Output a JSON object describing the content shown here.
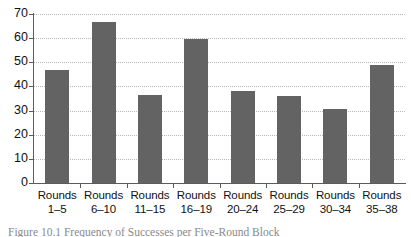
{
  "chart_data": {
    "type": "bar",
    "title": "",
    "subtitle": "",
    "xlabel": "",
    "ylabel": "",
    "ylim": [
      0,
      70
    ],
    "yticks": [
      0,
      10,
      20,
      30,
      40,
      50,
      60,
      70
    ],
    "ytick_labels": [
      "0",
      "10",
      "20",
      "30",
      "40",
      "50",
      "60",
      "70"
    ],
    "grid": true,
    "legend": false,
    "legend_position": "none",
    "categories": [
      "Rounds 1–5",
      "Rounds 6–10",
      "Rounds 11–15",
      "Rounds 16–19",
      "Rounds 20–24",
      "Rounds 25–29",
      "Rounds 30–34",
      "Rounds 35–38"
    ],
    "category_lines": [
      {
        "line1": "Rounds",
        "line2": "1–5"
      },
      {
        "line1": "Rounds",
        "line2": "6–10"
      },
      {
        "line1": "Rounds",
        "line2": "11–15"
      },
      {
        "line1": "Rounds",
        "line2": "16–19"
      },
      {
        "line1": "Rounds",
        "line2": "20–24"
      },
      {
        "line1": "Rounds",
        "line2": "25–29"
      },
      {
        "line1": "Rounds",
        "line2": "30–34"
      },
      {
        "line1": "Rounds",
        "line2": "35–38"
      }
    ],
    "values": [
      47,
      66.5,
      36.5,
      59.5,
      38,
      36,
      30.5,
      49
    ],
    "bar_color": "#636363",
    "axis_color": "#5b5b5b",
    "grid_color": "#b9b9b9"
  },
  "caption": {
    "text": "Figure 10.1  Frequency of Successes per Five-Round Block"
  }
}
